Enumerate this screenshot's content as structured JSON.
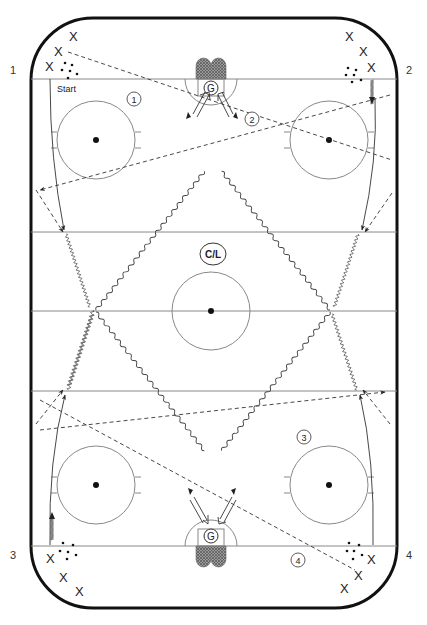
{
  "diagram": {
    "type": "hockey-drill",
    "corner_labels": [
      "1",
      "2",
      "3",
      "4"
    ],
    "start_label": "Start",
    "goalie_label": "G",
    "coach_label": "C/L",
    "sequence_numbers": [
      "1",
      "2",
      "3",
      "4"
    ],
    "player_symbol": "X",
    "colors": {
      "boards": "#111111",
      "lines": "#888888",
      "drawing": "#333333",
      "net": "#777777"
    },
    "stations": [
      {
        "corner": "1",
        "position": "top-left",
        "players": 3,
        "pucks": 6
      },
      {
        "corner": "2",
        "position": "top-right",
        "players": 3,
        "pucks": 6
      },
      {
        "corner": "3",
        "position": "bottom-left",
        "players": 3,
        "pucks": 6
      },
      {
        "corner": "4",
        "position": "bottom-right",
        "players": 3,
        "pucks": 6
      }
    ]
  }
}
